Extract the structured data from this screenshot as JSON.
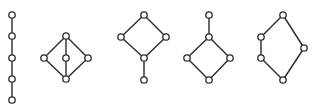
{
  "diagram": {
    "colors": {
      "stroke": "#2a2a2a",
      "node_fill": "#ffffff",
      "background": "#ffffff"
    },
    "node_radius": 3.2,
    "lattices": [
      {
        "name": "chain-5",
        "nodes": [
          [
            12,
            15
          ],
          [
            12,
            36
          ],
          [
            12,
            58
          ],
          [
            12,
            79
          ],
          [
            12,
            100
          ]
        ],
        "edges": [
          [
            0,
            1
          ],
          [
            1,
            2
          ],
          [
            2,
            3
          ],
          [
            3,
            4
          ]
        ]
      },
      {
        "name": "M3",
        "nodes": [
          [
            66,
            36
          ],
          [
            44,
            58
          ],
          [
            66,
            58
          ],
          [
            88,
            58
          ],
          [
            66,
            79
          ]
        ],
        "edges": [
          [
            0,
            1
          ],
          [
            0,
            2
          ],
          [
            0,
            3
          ],
          [
            1,
            4
          ],
          [
            2,
            4
          ],
          [
            3,
            4
          ]
        ]
      },
      {
        "name": "diamond-with-bottom-tail",
        "nodes": [
          [
            144,
            15
          ],
          [
            121,
            37
          ],
          [
            166,
            37
          ],
          [
            144,
            58
          ],
          [
            144,
            80
          ]
        ],
        "edges": [
          [
            0,
            1
          ],
          [
            0,
            2
          ],
          [
            1,
            3
          ],
          [
            2,
            3
          ],
          [
            3,
            4
          ]
        ]
      },
      {
        "name": "diamond-with-top-tail",
        "nodes": [
          [
            209,
            15
          ],
          [
            209,
            37
          ],
          [
            187,
            58
          ],
          [
            230,
            58
          ],
          [
            209,
            80
          ]
        ],
        "edges": [
          [
            0,
            1
          ],
          [
            1,
            2
          ],
          [
            1,
            3
          ],
          [
            2,
            4
          ],
          [
            3,
            4
          ]
        ]
      },
      {
        "name": "N5",
        "nodes": [
          [
            283,
            15
          ],
          [
            261,
            37
          ],
          [
            261,
            58
          ],
          [
            304,
            48
          ],
          [
            283,
            80
          ]
        ],
        "edges": [
          [
            0,
            1
          ],
          [
            1,
            2
          ],
          [
            2,
            4
          ],
          [
            0,
            3
          ],
          [
            3,
            4
          ]
        ]
      }
    ]
  }
}
